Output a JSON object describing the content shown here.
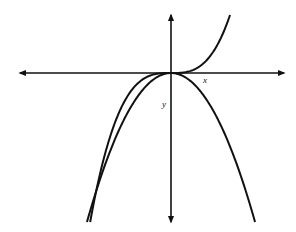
{
  "chart_data": {
    "type": "line",
    "title": "",
    "xlabel": "x",
    "ylabel": "y",
    "grid": false,
    "legend": null,
    "axes": {
      "origin_px": [
        171,
        73
      ],
      "x_axis_px": [
        20,
        284
      ],
      "y_axis_px": [
        15,
        222
      ],
      "arrows": "both-ends"
    },
    "series": [
      {
        "name": "cubic",
        "equation": "y = x^3",
        "description": "Increasing cubic passing through origin with horizontal inflection; rises steeply to upper right, falls to lower left",
        "color": "#111111"
      },
      {
        "name": "parabola",
        "equation": "y = -x^2",
        "description": "Downward-opening parabola with vertex at origin",
        "color": "#111111"
      }
    ],
    "annotations": [
      {
        "text": "x",
        "position": "below x-axis, right of origin"
      },
      {
        "text": "y",
        "position": "left of y-axis, below origin"
      }
    ]
  },
  "labels": {
    "x": "x",
    "y": "y"
  },
  "style": {
    "stroke_color": "#111111",
    "background": "#ffffff"
  }
}
